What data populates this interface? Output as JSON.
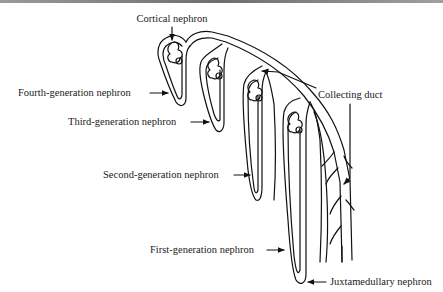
{
  "figure": {
    "labels": {
      "cortical": "Cortical nephron",
      "fourth": "Fourth-generation nephron",
      "third": "Third-generation nephron",
      "second": "Second-generation nephron",
      "first": "First-generation nephron",
      "juxtamedullary": "Juxtamedullary nephron",
      "collecting_duct": "Collecting duct"
    },
    "colors": {
      "line": "#111111",
      "text": "#1a1a1a",
      "background": "#ffffff",
      "top_rule": "#7a7a7a"
    }
  }
}
